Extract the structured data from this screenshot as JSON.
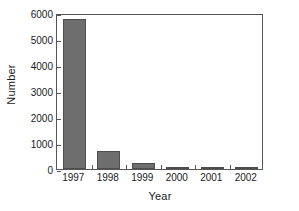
{
  "chart_data": {
    "type": "bar",
    "title": "",
    "xlabel": "Year",
    "ylabel": "Number",
    "categories": [
      "1997",
      "1998",
      "1999",
      "2000",
      "2001",
      "2002"
    ],
    "values": [
      5780,
      680,
      250,
      70,
      90,
      95
    ],
    "series": [
      {
        "name": "Number",
        "values": [
          5780,
          680,
          250,
          70,
          90,
          95
        ]
      }
    ],
    "ylim": [
      0,
      6000
    ],
    "ytick_labels": [
      "0",
      "1000",
      "2000",
      "3000",
      "4000",
      "5000",
      "6000"
    ],
    "ytick_values": [
      0,
      1000,
      2000,
      3000,
      4000,
      5000,
      6000
    ],
    "grid": false,
    "legend": "none",
    "bar_color": "#6e6e6e",
    "bar_edge_color": "#4e4e4e",
    "axis_color": "#565656",
    "background_color": "#ffffff"
  }
}
